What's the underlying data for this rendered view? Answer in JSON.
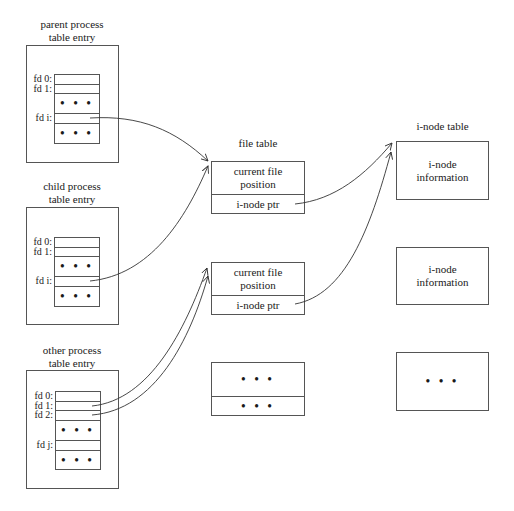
{
  "processes": [
    {
      "title_line1": "parent process",
      "title_line2": "table entry",
      "rows": [
        {
          "label": "fd 0:",
          "content": ""
        },
        {
          "label": "fd 1:",
          "content": ""
        },
        {
          "label": "",
          "content": "• • •"
        },
        {
          "label": "fd i:",
          "content": ""
        },
        {
          "label": "",
          "content": "• • •"
        }
      ]
    },
    {
      "title_line1": "child process",
      "title_line2": "table entry",
      "rows": [
        {
          "label": "fd 0:",
          "content": ""
        },
        {
          "label": "fd 1:",
          "content": ""
        },
        {
          "label": "",
          "content": "• • •"
        },
        {
          "label": "fd i:",
          "content": ""
        },
        {
          "label": "",
          "content": "• • •"
        }
      ]
    },
    {
      "title_line1": "other process",
      "title_line2": "table entry",
      "rows": [
        {
          "label": "fd 0:",
          "content": ""
        },
        {
          "label": "fd 1:",
          "content": ""
        },
        {
          "label": "fd 2:",
          "content": ""
        },
        {
          "label": "",
          "content": "• • •"
        },
        {
          "label": "fd j:",
          "content": ""
        },
        {
          "label": "",
          "content": "• • •"
        }
      ]
    }
  ],
  "file_table": {
    "title": "file table",
    "entries": [
      {
        "top": "current file position",
        "top_line1": "current file",
        "top_line2": "position",
        "bottom": "i-node ptr"
      },
      {
        "top": "current file position",
        "top_line1": "current file",
        "top_line2": "position",
        "bottom": "i-node ptr"
      },
      {
        "top_line1": "• • •",
        "top_line2": "",
        "bottom": "• • •"
      }
    ]
  },
  "inode_table": {
    "title": "i-node table",
    "entries": [
      {
        "line1": "i-node",
        "line2": "information"
      },
      {
        "line1": "i-node",
        "line2": "information"
      },
      {
        "line1": "• • •",
        "line2": ""
      }
    ]
  },
  "connections": [
    {
      "from": "parent fd i",
      "to": "file table entry 1"
    },
    {
      "from": "child fd i",
      "to": "file table entry 1"
    },
    {
      "from": "other fd 1",
      "to": "file table entry 2"
    },
    {
      "from": "other fd 2",
      "to": "file table entry 2"
    },
    {
      "from": "file table entry 1 i-node ptr",
      "to": "i-node table entry 1"
    },
    {
      "from": "file table entry 2 i-node ptr",
      "to": "i-node table entry 1"
    }
  ],
  "colors": {
    "line": "#555555",
    "text": "#1a1a1a",
    "background": "#ffffff"
  }
}
